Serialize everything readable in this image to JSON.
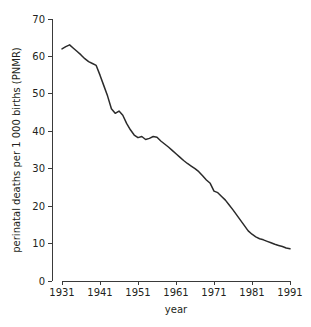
{
  "chart_data": {
    "type": "line",
    "title": "",
    "xlabel": "year",
    "ylabel": "perinatal deaths per 1 000 births (PNMR)",
    "xlim": [
      1931,
      1991
    ],
    "ylim": [
      0,
      70
    ],
    "grid": false,
    "legend": "none",
    "xticks": [
      1931,
      1941,
      1951,
      1961,
      1971,
      1981,
      1991
    ],
    "xtick_labels": [
      "1931",
      "1941",
      "1951",
      "1961",
      "1971",
      "1981",
      "1991"
    ],
    "yticks": [
      0,
      10,
      20,
      30,
      40,
      50,
      60,
      70
    ],
    "ytick_labels": [
      "0",
      "10",
      "20",
      "30",
      "40",
      "50",
      "60",
      "70"
    ],
    "line_color": "#2b2b2b",
    "axis_color": "#3a3a3a",
    "series": [
      {
        "name": "PNMR",
        "x": [
          1931,
          1932,
          1933,
          1934,
          1935,
          1936,
          1937,
          1938,
          1939,
          1940,
          1941,
          1942,
          1943,
          1944,
          1945,
          1946,
          1947,
          1948,
          1949,
          1950,
          1951,
          1952,
          1953,
          1954,
          1955,
          1956,
          1957,
          1958,
          1959,
          1960,
          1961,
          1962,
          1963,
          1964,
          1965,
          1966,
          1967,
          1968,
          1969,
          1970,
          1971,
          1972,
          1973,
          1974,
          1975,
          1976,
          1977,
          1978,
          1979,
          1980,
          1981,
          1982,
          1983,
          1984,
          1985,
          1986,
          1987,
          1988,
          1989,
          1990,
          1991
        ],
        "values": [
          62.0,
          62.6,
          63.1,
          62.2,
          61.3,
          60.4,
          59.4,
          58.6,
          58.1,
          57.6,
          55.0,
          52.2,
          49.4,
          46.0,
          44.8,
          45.4,
          44.3,
          42.1,
          40.4,
          39.0,
          38.3,
          38.6,
          37.8,
          38.1,
          38.6,
          38.4,
          37.4,
          36.6,
          35.8,
          34.9,
          34.0,
          33.1,
          32.2,
          31.4,
          30.7,
          30.0,
          29.2,
          28.1,
          27.0,
          26.1,
          24.0,
          23.6,
          22.6,
          21.6,
          20.3,
          19.0,
          17.6,
          16.2,
          14.8,
          13.4,
          12.5,
          11.8,
          11.3,
          11.0,
          10.6,
          10.2,
          9.8,
          9.5,
          9.2,
          8.8,
          8.6
        ]
      }
    ]
  },
  "figure": {
    "background": "#ffffff"
  }
}
